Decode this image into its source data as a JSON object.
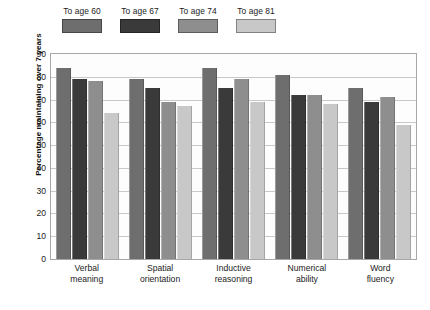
{
  "chart_data": {
    "type": "bar",
    "title": "",
    "xlabel": "",
    "ylabel": "Percentage maintaining over 7 years",
    "ylim": [
      0,
      90
    ],
    "yticks": [
      90,
      80,
      70,
      60,
      50,
      40,
      30,
      20,
      10,
      0
    ],
    "grid": true,
    "legend_position": "top",
    "categories": [
      "Verbal meaning",
      "Spatial orientation",
      "Inductive reasoning",
      "Numerical ability",
      "Word fluency"
    ],
    "category_lines": [
      [
        "Verbal",
        "meaning"
      ],
      [
        "Spatial",
        "orientation"
      ],
      [
        "Inductive",
        "reasoning"
      ],
      [
        "Numerical",
        "ability"
      ],
      [
        "Word",
        "fluency"
      ]
    ],
    "series": [
      {
        "name": "To age 60",
        "color": "#6e6e6e",
        "values": [
          84,
          79,
          84,
          81,
          75
        ]
      },
      {
        "name": "To age 67",
        "color": "#3a3a3a",
        "values": [
          79,
          75,
          75,
          72,
          69
        ]
      },
      {
        "name": "To age 74",
        "color": "#8e8e8e",
        "values": [
          78,
          69,
          79,
          72,
          71
        ]
      },
      {
        "name": "To age 81",
        "color": "#c8c8c8",
        "values": [
          64,
          67,
          69,
          68,
          59
        ]
      }
    ]
  },
  "caption": ""
}
